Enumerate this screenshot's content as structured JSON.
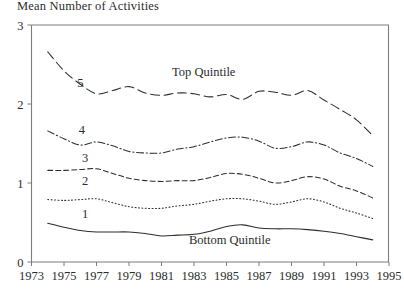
{
  "chart_data": {
    "type": "line",
    "title": "Mean Number of Activities",
    "xlabel": "",
    "ylabel": "Mean Number of Activities",
    "xlim": [
      1973,
      1995
    ],
    "ylim": [
      0,
      3
    ],
    "grid": false,
    "legend": "inline-labels",
    "ytick_labels": [
      "0",
      "1",
      "2",
      "3"
    ],
    "ytick_values": [
      0,
      1,
      2,
      3
    ],
    "xtick_labels": [
      "1973",
      "1975",
      "1977",
      "1979",
      "1981",
      "1983",
      "1985",
      "1987",
      "1989",
      "1991",
      "1993",
      "1995"
    ],
    "xtick_values": [
      1973,
      1975,
      1977,
      1979,
      1981,
      1983,
      1985,
      1987,
      1989,
      1991,
      1993,
      1995
    ],
    "x": [
      1974,
      1975,
      1976,
      1977,
      1978,
      1979,
      1980,
      1981,
      1982,
      1983,
      1984,
      1985,
      1986,
      1987,
      1988,
      1989,
      1990,
      1991,
      1992,
      1993,
      1994
    ],
    "annotations": [
      {
        "text": "Top Quintile",
        "x": 1983.6,
        "y": 2.36
      },
      {
        "text": "Bottom Quintile",
        "x": 1985.2,
        "y": 0.23
      }
    ],
    "series": [
      {
        "name": "5",
        "label": "5",
        "label_x": 1976.0,
        "label_y": 2.22,
        "dash": "long-dash",
        "values": [
          2.66,
          2.42,
          2.25,
          2.13,
          2.17,
          2.22,
          2.14,
          2.11,
          2.14,
          2.13,
          2.09,
          2.12,
          2.06,
          2.16,
          2.15,
          2.11,
          2.17,
          2.05,
          1.93,
          1.8,
          1.6
        ]
      },
      {
        "name": "4",
        "label": "4",
        "label_x": 1976.1,
        "label_y": 1.62,
        "dash": "dash-dot",
        "values": [
          1.66,
          1.56,
          1.48,
          1.52,
          1.47,
          1.4,
          1.38,
          1.38,
          1.43,
          1.46,
          1.52,
          1.57,
          1.58,
          1.53,
          1.44,
          1.46,
          1.52,
          1.48,
          1.38,
          1.31,
          1.21
        ]
      },
      {
        "name": "3",
        "label": "3",
        "label_x": 1976.3,
        "label_y": 1.27,
        "dash": "short-dash",
        "values": [
          1.16,
          1.16,
          1.17,
          1.18,
          1.12,
          1.06,
          1.03,
          1.02,
          1.03,
          1.03,
          1.07,
          1.12,
          1.11,
          1.06,
          1.0,
          1.03,
          1.08,
          1.05,
          0.96,
          0.9,
          0.81
        ]
      },
      {
        "name": "2",
        "label": "2",
        "label_x": 1976.3,
        "label_y": 0.97,
        "dash": "dotted",
        "values": [
          0.79,
          0.78,
          0.79,
          0.8,
          0.75,
          0.7,
          0.68,
          0.68,
          0.71,
          0.73,
          0.77,
          0.8,
          0.8,
          0.77,
          0.73,
          0.76,
          0.8,
          0.76,
          0.68,
          0.62,
          0.55
        ]
      },
      {
        "name": "1",
        "label": "1",
        "label_x": 1976.3,
        "label_y": 0.56,
        "dash": "solid",
        "values": [
          0.49,
          0.44,
          0.4,
          0.38,
          0.38,
          0.38,
          0.36,
          0.33,
          0.34,
          0.35,
          0.39,
          0.45,
          0.47,
          0.43,
          0.42,
          0.42,
          0.41,
          0.39,
          0.36,
          0.32,
          0.28
        ]
      }
    ]
  }
}
